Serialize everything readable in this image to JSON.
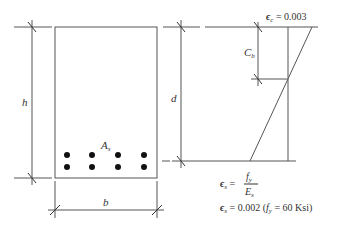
{
  "diagram": {
    "section": {
      "height_label": "h",
      "width_label": "b",
      "steel_label": "A",
      "steel_sub": "s",
      "rebar_rows": 2,
      "rebar_cols": 4
    },
    "strain": {
      "depth_label": "d",
      "neutral_axis_label": "C",
      "neutral_axis_sub": "b",
      "concrete_strain_label": "ϵ",
      "concrete_strain_sub": "c",
      "concrete_strain_value": " = 0.003",
      "steel_strain_symbol": "ϵ",
      "steel_strain_sub": "s",
      "steel_strain_eq": " = ",
      "fy_num": "f",
      "fy_sub": "y",
      "es_den": "E",
      "es_sub": "s",
      "steel_strain_value_line": " = 0.002 (",
      "fy_value": " = 60 Ksi)"
    }
  }
}
